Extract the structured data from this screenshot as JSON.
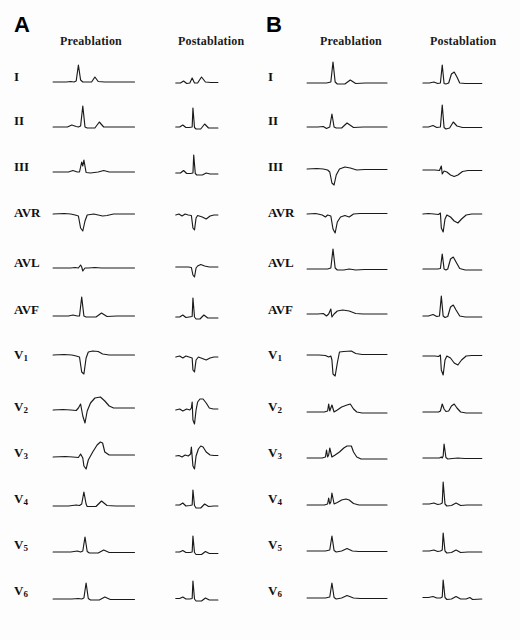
{
  "figure": {
    "background_color": "#fdfdfd",
    "trace_color": "#1b1b1b"
  },
  "panels": [
    {
      "letter": "A",
      "columns": [
        {
          "key": "pre",
          "label": "Preablation"
        },
        {
          "key": "post",
          "label": "Postablation"
        }
      ],
      "leads": [
        {
          "name": "I",
          "base": "I",
          "sub": ""
        },
        {
          "name": "II",
          "base": "II",
          "sub": ""
        },
        {
          "name": "III",
          "base": "III",
          "sub": ""
        },
        {
          "name": "AVR",
          "base": "AVR",
          "sub": ""
        },
        {
          "name": "AVL",
          "base": "AVL",
          "sub": ""
        },
        {
          "name": "AVF",
          "base": "AVF",
          "sub": ""
        },
        {
          "name": "V1",
          "base": "V",
          "sub": "1"
        },
        {
          "name": "V2",
          "base": "V",
          "sub": "2"
        },
        {
          "name": "V3",
          "base": "V",
          "sub": "3"
        },
        {
          "name": "V4",
          "base": "V",
          "sub": "4"
        },
        {
          "name": "V5",
          "base": "V",
          "sub": "5"
        },
        {
          "name": "V6",
          "base": "V",
          "sub": "6"
        }
      ]
    },
    {
      "letter": "B",
      "columns": [
        {
          "key": "pre",
          "label": "Preablation"
        },
        {
          "key": "post",
          "label": "Postablation"
        }
      ],
      "leads": [
        {
          "name": "I",
          "base": "I",
          "sub": ""
        },
        {
          "name": "II",
          "base": "II",
          "sub": ""
        },
        {
          "name": "III",
          "base": "III",
          "sub": ""
        },
        {
          "name": "AVR",
          "base": "AVR",
          "sub": ""
        },
        {
          "name": "AVL",
          "base": "AVL",
          "sub": ""
        },
        {
          "name": "AVF",
          "base": "AVF",
          "sub": ""
        },
        {
          "name": "V1",
          "base": "V",
          "sub": "1"
        },
        {
          "name": "V2",
          "base": "V",
          "sub": "2"
        },
        {
          "name": "V3",
          "base": "V",
          "sub": "3"
        },
        {
          "name": "V4",
          "base": "V",
          "sub": "4"
        },
        {
          "name": "V5",
          "base": "V",
          "sub": "5"
        },
        {
          "name": "V6",
          "base": "V",
          "sub": "6"
        }
      ]
    }
  ],
  "chart_data": {
    "type": "line",
    "xlabel": "time",
    "ylabel": "amplitude",
    "grid": false,
    "legend": "none",
    "viewbox": {
      "x": 0,
      "y": 0,
      "w": 200,
      "h": 48
    },
    "baseline_y": 30,
    "note": "Each waveform is stored as an SVG polyline path in viewBox 0 0 200 48; y increases downward, baseline at y=30.",
    "waveforms": {
      "A": {
        "pre": {
          "I": "M2,30 L26,30 L34,29.5 L40,30 L44,29 L48,13 L52,28 L56,30 L72,30 L78,25 L84,29.5 L96,30 L150,30",
          "II": "M2,31 L28,31 L36,29 L44,30.5 L48,31 L52,30 L56,10 L60,31 L64,32 L78,32 L86,26 L94,31 L110,31 L150,31",
          "III": "M2,30 L30,30 L38,28.5 L46,30 L50,30 L54,20 L56,24 L58,18 L62,30.5 L70,31 L84,30 L94,28.5 L104,30 L150,30",
          "AVR": "M2,26 L22,25.5 L34,26 L42,27 L48,28 L52,40 L56,43 L60,33 L64,27 L76,26 L84,27 L92,28 L100,27.5 L112,26 L150,26",
          "AVL": "M2,30 L34,30 L42,29.5 L48,30 L52,27 L54,29 L56,33 L60,30 L66,30 L78,29.5 L90,30 L150,30",
          "AVF": "M2,31 L30,31 L38,30 L46,31 L50,31 L54,12 L58,31 L62,32 L80,32 L90,28 L100,31.5 L118,31 L150,31",
          "V1": "M2,25 L22,24.5 L36,25 L44,26 L50,27 L54,42 L58,44 L62,28 L66,22 L74,21 L84,21.5 L92,24 L104,25 L150,25",
          "V2": "M2,28 L20,27.5 L34,28 L44,28.5 L48,26 L52,22 L56,34 L60,41 L64,29 L70,21 L78,16 L88,15 L96,19 L104,24 L112,26 L126,26 L150,26",
          "V3": "M2,29 L24,28.5 L38,29 L48,29.5 L52,26 L56,30 L58,38 L62,41 L66,32 L74,24 L82,17 L88,14 L92,15 L96,24 L104,27 L118,27 L150,27",
          "V4": "M2,32 L30,32 L44,31 L50,31.5 L54,30 L58,18 L62,30 L64,32.5 L80,32.5 L90,27 L100,31.5 L116,32 L150,32",
          "V5": "M2,32 L34,32 L46,31 L52,32 L56,31 L60,17 L64,31.5 L68,33 L84,33 L94,30 L104,32.5 L120,32.5 L150,32.5",
          "V6": "M2,33 L36,33 L48,32.5 L54,33 L58,32 L62,17 L66,32.5 L70,34 L86,34 L96,31 L106,33.5 L124,33.5 L150,33.5"
        },
        "post": {
          "I": "M2,31 L14,31 L22,29 L30,31.5 L38,31 L44,26 L50,31 L58,31 L68,25 L78,30 L92,30.5 L110,30.5",
          "II": "M2,31 L12,31 L20,29 L28,31.5 L36,31.5 L44,31 L46,12 L50,31.5 L54,33 L66,33 L76,28 L86,32 L100,32 L110,32",
          "III": "M2,31 L14,31 L22,28.5 L30,31.5 L40,31.5 L46,31 L48,13 L52,31.5 L56,33 L70,33 L80,31 L90,32 L110,32",
          "AVR": "M2,27 L10,26 L18,28 L26,26 L34,27 L42,27.5 L46,40 L50,42 L54,30 L58,27.5 L70,29 L80,31 L90,28 L100,27 L110,27",
          "AVL": "M2,29 L20,29 L34,29 L42,29.5 L46,37 L50,39 L54,30 L58,28 L66,26.5 L76,28 L88,29 L110,29",
          "AVF": "M2,32 L12,32 L20,30 L28,32.5 L36,32 L44,31.5 L46,13 L50,32 L54,34 L64,34 L74,30 L84,33 L100,33 L110,33",
          "V1": "M2,27 L12,26 L20,28 L28,26 L36,27 L44,28 L46,40 L50,42 L54,30 L60,27 L70,28.5 L80,30 L90,28 L100,27 L110,27",
          "V2": "M2,28 L12,27 L20,29 L30,27 L38,28 L42,26 L44,20 L46,38 L50,42 L54,28 L58,20 L64,17 L72,17 L80,21 L88,26 L98,27 L110,27",
          "V3": "M2,28 L10,27.5 L18,29 L26,27 L34,28 L40,26 L42,19 L46,38 L50,41 L54,28 L60,21 L66,18 L72,19 L80,24 L90,27 L100,27.5 L110,27.5",
          "V4": "M2,31 L12,31 L20,29 L28,32 L38,31.5 L44,31 L46,16 L50,31.5 L54,34 L66,34 L76,30 L86,32.5 L100,32 L110,32",
          "V5": "M2,32 L12,32 L20,30.5 L28,32.5 L38,32.5 L44,32 L46,16 L50,32.5 L54,34.5 L68,34.5 L78,31.5 L88,33.5 L102,33.5 L110,33.5",
          "V6": "M2,32.5 L12,32.5 L20,31 L28,33 L38,33 L44,32.5 L46,15 L50,33 L54,35 L68,35 L78,32 L88,34 L102,34 L110,34"
        }
      },
      "B": {
        "pre": {
          "I": "M2,31 L26,31 L38,31 L46,30 L50,10 L54,30 L58,32 L72,32 L82,28 L92,31.5 L110,31 L150,31",
          "II": "M2,31 L22,31 L32,30.5 L38,32.5 L44,31 L48,18 L52,31 L56,32 L66,32 L76,27 L88,31.5 L106,31 L150,31",
          "III": "M2,27 L20,26.5 L32,27 L40,28 L44,30 L48,41 L52,43 L56,33 L62,27 L72,25 L82,26 L94,28 L108,27.5 L150,27.5",
          "AVR": "M2,26 L18,25.5 L30,27 L36,29 L40,27 L46,28 L50,41 L54,45 L58,34 L64,29 L72,27.5 L80,29 L88,26 L100,25.5 L118,25.5 L150,25.5",
          "AVL": "M2,31 L26,31 L40,31 L46,30 L50,11 L54,30 L58,32 L70,32 L80,31 L92,32 L108,31.5 L150,31.5",
          "AVF": "M2,29 L22,29 L32,28.5 L38,31 L42,29 L46,24 L48,32 L52,29 L58,26 L68,25 L80,26 L92,28.5 L106,29 L150,29",
          "V1": "M2,25 L24,25 L36,25.5 L42,27 L46,26 L48,30 L50,44 L54,46 L58,33 L62,22 L70,21.5 L84,21 L92,23.5 L104,24.5 L150,24.5",
          "V2": "M2,30 L20,30 L34,30 L40,29 L42,22 L44,29 L46,26 L48,23 L52,30 L58,28 L66,25 L76,23 L82,22 L88,27 L94,30 L104,31 L120,31 L150,31",
          "V3": "M2,30 L18,30 L30,30 L36,29 L38,22 L40,29 L42,27 L44,20 L48,29 L54,27 L62,24 L70,20 L76,18 L84,18 L88,24 L94,29 L102,31 L118,31 L150,31",
          "V4": "M2,31 L22,31 L34,31 L40,30 L42,24 L44,30 L46,28 L48,19 L52,30 L58,28.5 L66,26 L74,25 L80,26 L88,29.5 L98,31 L114,31 L150,31",
          "V5": "M2,31 L24,31 L36,31 L44,30 L48,16 L52,30.5 L56,32 L66,31 L76,28.5 L86,31 L98,31.5 L114,31.5 L150,31.5",
          "V6": "M2,32 L24,32 L36,32 L44,31 L48,17 L52,31.5 L56,33 L66,32 L76,29.5 L88,32 L100,32.5 L116,32.5 L150,32.5"
        },
        "post": {
          "I": "M2,31 L16,31 L26,30 L34,31.5 L40,31 L44,13 L48,31.5 L52,32 L58,31 L64,22 L70,20 L76,25 L82,31 L94,31.5 L130,31.5",
          "II": "M2,31 L14,31 L24,29.5 L32,31.5 L40,31 L44,9 L48,31.5 L52,33 L60,32 L68,26 L76,30 L88,31.5 L130,31.5",
          "III": "M2,28 L16,28 L28,28 L38,28.5 L42,24 L44,32 L48,29 L54,30 L62,33 L70,34.5 L78,33 L88,29.5 L100,28.5 L130,28.5",
          "AVR": "M2,26 L14,25.5 L26,26 L36,26.5 L40,25 L42,40 L46,44 L50,31 L54,27 L62,29 L70,33 L78,35 L86,31 L96,27 L108,26 L130,26",
          "AVL": "M2,31 L14,31 L24,31 L34,31 L40,30.5 L44,16 L48,31 L52,32 L56,31 L62,21 L68,19 L74,24 L82,30.5 L94,32 L130,32",
          "AVF": "M2,31 L14,31 L24,29.5 L32,31.5 L38,31 L42,11 L46,31 L50,32.5 L56,31.5 L62,22 L68,20 L74,25 L82,31 L94,32 L130,32",
          "V1": "M2,26 L16,26 L28,26 L36,26.5 L40,25 L42,40 L46,45 L50,30 L54,26 L62,28 L70,33 L78,35 L86,30 L96,26 L108,25.5 L130,25.5",
          "V2": "M2,30 L16,30 L28,30 L36,30 L40,29 L44,22 L48,27 L52,29.5 L58,29 L64,24 L70,22 L76,26 L84,30 L96,31 L130,31",
          "V3": "M2,30 L18,30 L30,30 L38,30 L42,29 L44,30 L46,28 L48,16 L52,29.5 L56,31 L66,30.5 L78,30 L92,30.5 L130,30.5",
          "V4": "M2,30 L16,30 L26,29 L34,30.5 L40,30 L44,29 L46,8 L50,30 L54,32 L64,31.5 L74,29 L84,31.5 L98,31 L130,31",
          "V5": "M2,31 L16,31 L26,30 L34,31.5 L40,31 L44,30 L46,13 L50,31 L54,33 L64,32.5 L74,30 L84,32.5 L100,32 L130,32",
          "V6": "M2,31.5 L14,31.5 L24,30.5 L32,32 L40,32 L44,31 L46,14 L50,31.5 L54,33.5 L64,33 L74,30.5 L84,33 L96,33 L104,31.5 L110,33.5 L130,33"
        }
      }
    }
  }
}
